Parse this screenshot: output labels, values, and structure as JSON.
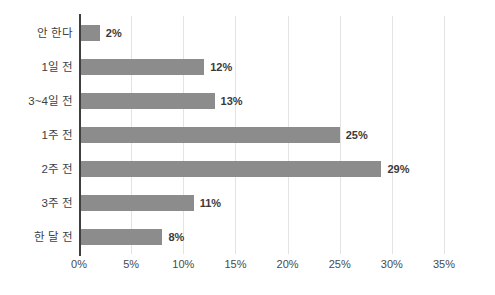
{
  "chart_data": {
    "type": "bar",
    "orientation": "horizontal",
    "title": "",
    "subtitle": "",
    "xlabel": "",
    "ylabel": "",
    "categories": [
      "안 한다",
      "1일 전",
      "3~4일 전",
      "1주 전",
      "2주 전",
      "3주 전",
      "한 달 전"
    ],
    "values": [
      2,
      12,
      13,
      25,
      29,
      11,
      8
    ],
    "data_labels": [
      "2%",
      "12%",
      "13%",
      "25%",
      "29%",
      "11%",
      "8%"
    ],
    "xlim": [
      0,
      35
    ],
    "xticks": [
      0,
      5,
      10,
      15,
      20,
      25,
      30,
      35
    ],
    "xtick_labels": [
      "0%",
      "5%",
      "10%",
      "15%",
      "20%",
      "25%",
      "30%",
      "35%"
    ],
    "grid": "vertical",
    "legend": "none",
    "colors": {
      "bar": "#8c8c8c",
      "gridline": "#e3e3e3",
      "axis": "#3f3f3f",
      "label_text": "#404040",
      "value_text": "#3a3a3a",
      "background": "#ffffff"
    }
  }
}
